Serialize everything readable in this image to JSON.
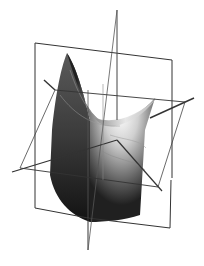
{
  "figure": {
    "colors": {
      "background": "#ffffff",
      "frame_lines": "#333333",
      "axis_lines": "#444444",
      "surface_dark": "#1a1a1a",
      "surface_light": "#f2f2f2"
    }
  }
}
